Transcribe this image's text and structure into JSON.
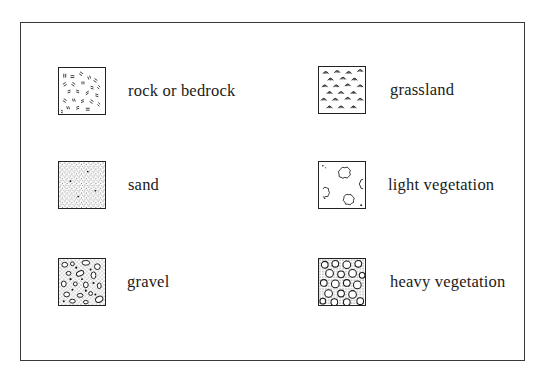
{
  "legend": {
    "items": [
      {
        "id": "rock",
        "label": "rock or bedrock",
        "pattern": "rock-pattern-icon"
      },
      {
        "id": "sand",
        "label": "sand",
        "pattern": "sand-pattern-icon"
      },
      {
        "id": "gravel",
        "label": "gravel",
        "pattern": "gravel-pattern-icon"
      },
      {
        "id": "grassland",
        "label": "grassland",
        "pattern": "grassland-pattern-icon"
      },
      {
        "id": "light_vegetation",
        "label": "light vegetation",
        "pattern": "light-vegetation-pattern-icon"
      },
      {
        "id": "heavy_vegetation",
        "label": "heavy vegetation",
        "pattern": "heavy-vegetation-pattern-icon"
      }
    ]
  },
  "colors": {
    "ink": "#1a1a1a",
    "frame": "#3a3a3a",
    "background": "#ffffff"
  }
}
